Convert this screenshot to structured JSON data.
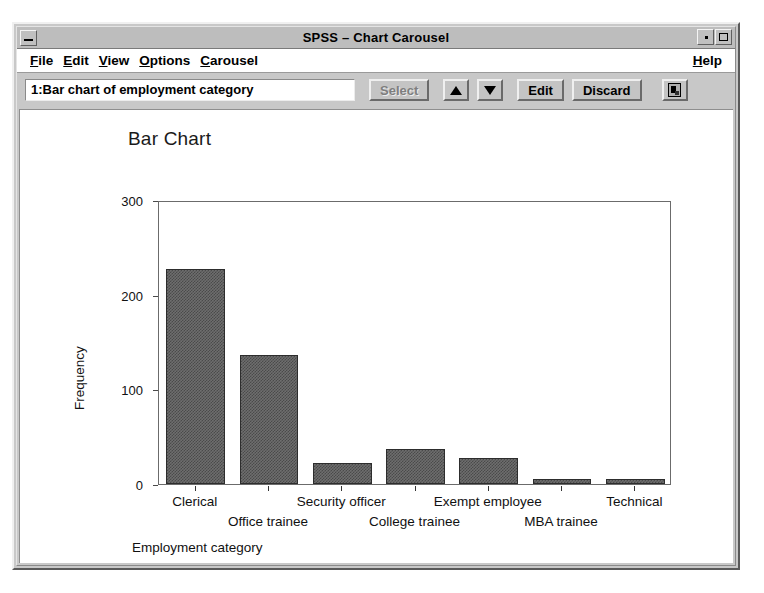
{
  "window": {
    "title": "SPSS – Chart Carousel",
    "minimize_icon": "window-minimize-icon",
    "restore_icon": "window-restore-icon",
    "maximize_icon": "window-maximize-icon"
  },
  "menubar": {
    "items": [
      {
        "label": "File",
        "mnemonic": "F",
        "rest": "ile"
      },
      {
        "label": "Edit",
        "mnemonic": "E",
        "rest": "dit"
      },
      {
        "label": "View",
        "mnemonic": "V",
        "rest": "iew"
      },
      {
        "label": "Options",
        "mnemonic": "O",
        "rest": "ptions"
      },
      {
        "label": "Carousel",
        "mnemonic": "C",
        "rest": "arousel"
      }
    ],
    "help": {
      "label": "Help",
      "mnemonic": "H",
      "rest": "elp"
    }
  },
  "toolbar": {
    "chart_field_value": "1:Bar chart of employment category",
    "chart_field_placeholder": "",
    "select_label": "Select",
    "select_disabled": true,
    "prev_icon": "triangle-up-icon",
    "next_icon": "triangle-down-icon",
    "edit_label": "Edit",
    "discard_label": "Discard",
    "export_icon": "document-icon"
  },
  "chart_data": {
    "type": "bar",
    "title": "Bar Chart",
    "xlabel": "Employment category",
    "ylabel": "Frequency",
    "categories": [
      "Clerical",
      "Office trainee",
      "Security officer",
      "College trainee",
      "Exempt employee",
      "MBA trainee",
      "Technical"
    ],
    "values": [
      227,
      136,
      22,
      37,
      28,
      5,
      5
    ],
    "ylim": [
      0,
      300
    ],
    "yticks": [
      0,
      100,
      200,
      300
    ],
    "ytick_labels": [
      "0",
      "100",
      "200",
      "300"
    ],
    "grid": false,
    "legend": false,
    "bar_color": "#6e6e6e",
    "bar_edge_color": "#2d2d2d"
  },
  "colors": {
    "window_face": "#c8c8c8",
    "titlebar": "#bdbdbd",
    "plot_background": "#ffffff",
    "axis": "#6b6b6b"
  }
}
